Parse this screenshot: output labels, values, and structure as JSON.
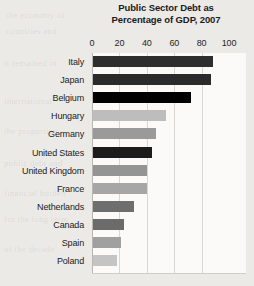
{
  "page": {
    "background_color": "#eceae6",
    "plot_background_color": "#fbfaf8",
    "gridline_color": "#d9d7d2"
  },
  "bleed_text": [
    "the economy of",
    "countries and",
    "it remained in",
    "international",
    "the proportion",
    "public debt and",
    "financial burden",
    "for the long term",
    "of the decade"
  ],
  "chart_data": {
    "type": "bar",
    "orientation": "horizontal",
    "title": "Public Sector Debt as Percentage of GDP, 2007",
    "title_lines": [
      "Public Sector Debt as",
      "Percentage of GDP, 2007"
    ],
    "xlabel": "",
    "ylabel": "",
    "xlim": [
      0,
      100
    ],
    "xticks": [
      0,
      20,
      40,
      60,
      80,
      100
    ],
    "xtick_labels": [
      "0",
      "20",
      "40",
      "60",
      "80",
      "100"
    ],
    "grid": true,
    "grid_axis": "x",
    "axis_position": "top",
    "legend": null,
    "categories": [
      "Italy",
      "Japan",
      "Belgium",
      "Hungary",
      "Germany",
      "United States",
      "United Kingdom",
      "France",
      "Netherlands",
      "Canada",
      "Spain",
      "Poland"
    ],
    "values": [
      88,
      87,
      72,
      54,
      47,
      44,
      40,
      40,
      31,
      23,
      21,
      18
    ],
    "bar_colors": [
      "#2e2e2e",
      "#2b2b2b",
      "#000000",
      "#bdbdbd",
      "#9a9a9a",
      "#1c1c1c",
      "#949494",
      "#a6a6a6",
      "#6e6e6e",
      "#6b6b6b",
      "#a0a0a0",
      "#c4c4c4"
    ],
    "bars": [
      {
        "label": "Italy",
        "value": 88,
        "color": "#2e2e2e"
      },
      {
        "label": "Japan",
        "value": 87,
        "color": "#2b2b2b"
      },
      {
        "label": "Belgium",
        "value": 72,
        "color": "#000000"
      },
      {
        "label": "Hungary",
        "value": 54,
        "color": "#bdbdbd"
      },
      {
        "label": "Germany",
        "value": 47,
        "color": "#9a9a9a"
      },
      {
        "label": "United States",
        "value": 44,
        "color": "#1c1c1c"
      },
      {
        "label": "United Kingdom",
        "value": 40,
        "color": "#949494"
      },
      {
        "label": "France",
        "value": 40,
        "color": "#a6a6a6"
      },
      {
        "label": "Netherlands",
        "value": 31,
        "color": "#6e6e6e"
      },
      {
        "label": "Canada",
        "value": 23,
        "color": "#6b6b6b"
      },
      {
        "label": "Spain",
        "value": 21,
        "color": "#a0a0a0"
      },
      {
        "label": "Poland",
        "value": 18,
        "color": "#c4c4c4"
      }
    ]
  }
}
